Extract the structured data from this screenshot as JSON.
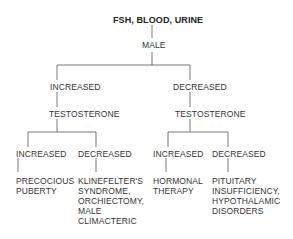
{
  "diagram": {
    "root": "FSH, BLOOD, URINE",
    "gender": "MALE",
    "branches": [
      {
        "label": "INCREASED",
        "test": "TESTOSTERONE",
        "children": [
          {
            "label": "INCREASED",
            "outcome": "PRECOCIOUS\nPUBERTY"
          },
          {
            "label": "DECREASED",
            "outcome": "KLINEFELTER'S\nSYNDROME,\nORCHIECTOMY,\nMALE\nCLIMACTERIC"
          }
        ]
      },
      {
        "label": "DECREASED",
        "test": "TESTOSTERONE",
        "children": [
          {
            "label": "INCREASED",
            "outcome": "HORMONAL\nTHERAPY"
          },
          {
            "label": "DECREASED",
            "outcome": "PITUITARY\nINSUFFICIENCY,\nHYPOTHALAMIC\nDISORDERS"
          }
        ]
      }
    ]
  }
}
